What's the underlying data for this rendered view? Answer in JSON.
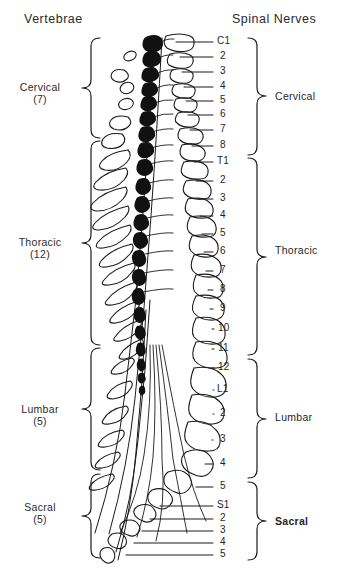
{
  "figure": {
    "title_left": "Vertebrae",
    "title_right": "Spinal Nerves",
    "bottom_caption": ""
  },
  "vertebrae_groups": [
    {
      "name": "Cervical",
      "count": "(7)",
      "label_y": 88,
      "brace_top": 38,
      "brace_bottom": 138
    },
    {
      "name": "Thoracic",
      "count": "(12)",
      "label_y": 243,
      "brace_top": 141,
      "brace_bottom": 345
    },
    {
      "name": "Lumbar",
      "count": "(5)",
      "label_y": 410,
      "brace_top": 348,
      "brace_bottom": 470
    },
    {
      "name": "Sacral",
      "count": "(5)",
      "label_y": 508,
      "brace_top": 474,
      "brace_bottom": 558
    }
  ],
  "nerve_groups": [
    {
      "name": "Cervical",
      "label_y": 96,
      "brace_top": 38,
      "brace_bottom": 155,
      "bold": false
    },
    {
      "name": "Thoracic",
      "label_y": 250,
      "brace_top": 158,
      "brace_bottom": 355,
      "bold": false
    },
    {
      "name": "Lumbar",
      "label_y": 417,
      "brace_top": 359,
      "brace_bottom": 478,
      "bold": false
    },
    {
      "name": "Sacral",
      "label_y": 521,
      "brace_top": 482,
      "brace_bottom": 560,
      "bold": true
    }
  ],
  "nerve_labels": [
    {
      "text": "C1",
      "y": 42
    },
    {
      "text": "2",
      "y": 57
    },
    {
      "text": "3",
      "y": 72
    },
    {
      "text": "4",
      "y": 87
    },
    {
      "text": "5",
      "y": 101
    },
    {
      "text": "6",
      "y": 115
    },
    {
      "text": "7",
      "y": 130
    },
    {
      "text": "8",
      "y": 146
    },
    {
      "text": "T1",
      "y": 162
    },
    {
      "text": "2",
      "y": 181
    },
    {
      "text": "3",
      "y": 199
    },
    {
      "text": "4",
      "y": 216
    },
    {
      "text": "5",
      "y": 234
    },
    {
      "text": "6",
      "y": 252
    },
    {
      "text": "7",
      "y": 271
    },
    {
      "text": "8",
      "y": 290
    },
    {
      "text": "9",
      "y": 309
    },
    {
      "text": "10",
      "y": 329
    },
    {
      "text": "11",
      "y": 349
    },
    {
      "text": "12",
      "y": 368
    },
    {
      "text": "L1",
      "y": 390
    },
    {
      "text": "2",
      "y": 414
    },
    {
      "text": "3",
      "y": 440
    },
    {
      "text": "4",
      "y": 464
    },
    {
      "text": "5",
      "y": 487
    },
    {
      "text": "S1",
      "y": 506
    },
    {
      "text": "2",
      "y": 519
    },
    {
      "text": "3",
      "y": 531
    },
    {
      "text": "4",
      "y": 543
    },
    {
      "text": "5",
      "y": 555
    }
  ],
  "colors": {
    "ink": "#1a1a1a",
    "cord": "#111111",
    "background": "#ffffff"
  }
}
